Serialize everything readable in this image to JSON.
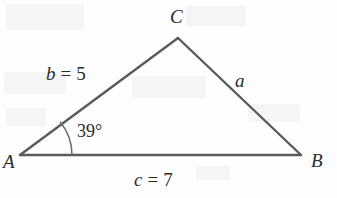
{
  "figure": {
    "type": "geometry-diagram",
    "shape": "triangle",
    "stroke_color": "#5a5a5a",
    "text_color": "#2b2b2b",
    "background_color": "#fefefe",
    "vertices": [
      {
        "name": "A",
        "label": "A",
        "x": 20,
        "y": 155
      },
      {
        "name": "B",
        "label": "B",
        "x": 301,
        "y": 155
      },
      {
        "name": "C",
        "label": "C",
        "x": 178,
        "y": 38
      }
    ],
    "vertex_labels": [
      {
        "id": "vertex-label-a",
        "text": "A",
        "x": 3,
        "y": 152
      },
      {
        "id": "vertex-label-b",
        "text": "B",
        "x": 311,
        "y": 151
      },
      {
        "id": "vertex-label-c",
        "text": "C",
        "x": 170,
        "y": 7
      }
    ],
    "sides": [
      {
        "id": "side-a",
        "name": "a",
        "label": "a",
        "value": "",
        "between": "B-C",
        "x": 235,
        "y": 71
      },
      {
        "id": "side-b",
        "name": "b",
        "label": "b",
        "equals": "=",
        "value": "5",
        "between": "A-C",
        "x": 46,
        "y": 64
      },
      {
        "id": "side-c",
        "name": "c",
        "label": "c",
        "equals": "=",
        "value": "7",
        "between": "A-B",
        "x": 134,
        "y": 170
      }
    ],
    "angle": {
      "id": "angle-a",
      "at_vertex": "A",
      "label": "39°",
      "degrees": 39,
      "arc_radius": 52,
      "label_x": 77,
      "label_y": 122
    }
  }
}
